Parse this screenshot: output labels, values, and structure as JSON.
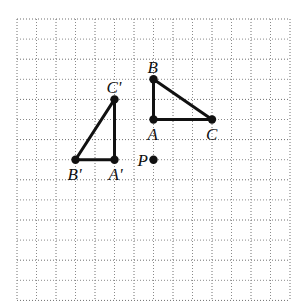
{
  "figure": {
    "type": "coordinate-grid-rotation",
    "grid": {
      "columns": 14,
      "rows": 14,
      "origin_px": [
        17,
        19
      ],
      "cell_w": 19.5,
      "cell_h": 20.1
    },
    "colors": {
      "grid": "#8a8a8a",
      "ink": "#111111",
      "background": "#ffffff"
    },
    "points": [
      {
        "id": "A",
        "label": "A",
        "col": 7,
        "row": 5,
        "label_dx": -6,
        "label_dy": 20
      },
      {
        "id": "B",
        "label": "B",
        "col": 7,
        "row": 3,
        "label_dx": -6,
        "label_dy": -6
      },
      {
        "id": "C",
        "label": "C",
        "col": 10,
        "row": 5,
        "label_dx": -6,
        "label_dy": 20
      },
      {
        "id": "P",
        "label": "P",
        "col": 7,
        "row": 7,
        "label_dx": -16,
        "label_dy": 6
      },
      {
        "id": "A1",
        "label": "A'",
        "col": 5,
        "row": 7,
        "label_dx": -6,
        "label_dy": 20
      },
      {
        "id": "B1",
        "label": "B'",
        "col": 3,
        "row": 7,
        "label_dx": -8,
        "label_dy": 20
      },
      {
        "id": "C1",
        "label": "C'",
        "col": 5,
        "row": 4,
        "label_dx": -8,
        "label_dy": -6
      }
    ],
    "triangles": [
      {
        "name": "triangle-ABC",
        "vertices": [
          "A",
          "B",
          "C"
        ]
      },
      {
        "name": "triangle-A'B'C'",
        "vertices": [
          "A1",
          "B1",
          "C1"
        ]
      }
    ]
  }
}
